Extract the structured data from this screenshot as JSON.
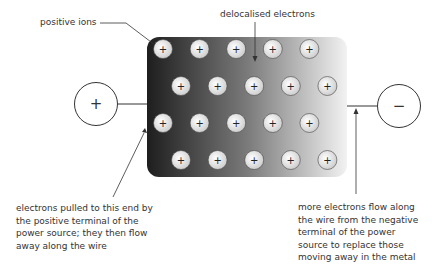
{
  "labels": {
    "positive_ions": "positive ions",
    "delocalised_electrons": "delocalised electrons",
    "left_note": [
      "electrons pulled to this end by",
      "the positive terminal of the",
      "power source; they then flow",
      "away along the wire"
    ],
    "right_note": [
      "more electrons flow along",
      "the wire from the negative",
      "terminal of the power",
      "source to replace those",
      "moving away in the metal"
    ]
  },
  "terminals": {
    "positive": "+",
    "negative": "−"
  },
  "ion_symbol": "+",
  "ion_rows": [
    5,
    5,
    5,
    5
  ]
}
